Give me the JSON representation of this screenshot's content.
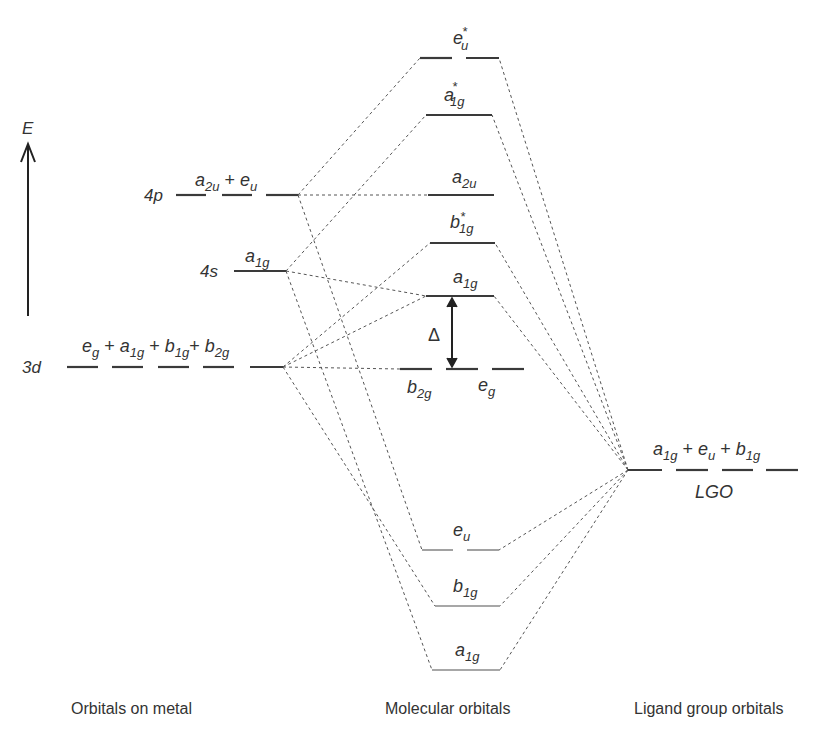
{
  "axis": {
    "label": "E"
  },
  "metal": {
    "caption": "Orbitals on metal",
    "levels": {
      "p4": {
        "name": "4p",
        "sym": "a",
        "sub1": "2u",
        "plus": "+",
        "sym2": "e",
        "sub2": "u"
      },
      "s4": {
        "name": "4s",
        "sym": "a",
        "sub": "1g"
      },
      "d3": {
        "name": "3d",
        "terms": [
          {
            "sym": "e",
            "sub": "g"
          },
          {
            "sym": "a",
            "sub": "1g"
          },
          {
            "sym": "b",
            "sub": "1g"
          },
          {
            "sym": "b",
            "sub": "2g"
          }
        ],
        "plus": "+"
      }
    }
  },
  "mo": {
    "caption": "Molecular orbitals",
    "levels": {
      "eu_star": {
        "sym": "e",
        "sub": "u",
        "star": "*"
      },
      "a1g_star": {
        "sym": "a",
        "sub": "1g",
        "star": "*"
      },
      "a2u": {
        "sym": "a",
        "sub": "2u"
      },
      "b1g_star": {
        "sym": "b",
        "sub": "1g",
        "star": "*"
      },
      "a1g": {
        "sym": "a",
        "sub": "1g"
      },
      "b2g": {
        "sym": "b",
        "sub": "2g"
      },
      "eg": {
        "sym": "e",
        "sub": "g"
      },
      "eu": {
        "sym": "e",
        "sub": "u"
      },
      "b1g": {
        "sym": "b",
        "sub": "1g"
      },
      "a1g_low": {
        "sym": "a",
        "sub": "1g"
      }
    },
    "delta": "Δ"
  },
  "ligand": {
    "caption": "Ligand group orbitals",
    "terms": [
      {
        "sym": "a",
        "sub": "1g"
      },
      {
        "sym": "e",
        "sub": "u"
      },
      {
        "sym": "b",
        "sub": "1g"
      }
    ],
    "plus": "+",
    "name": "LGO"
  }
}
